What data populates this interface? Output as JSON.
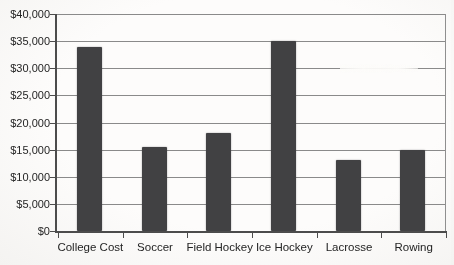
{
  "chart_data": {
    "type": "bar",
    "categories": [
      "College Cost",
      "Soccer",
      "Field Hockey",
      "Ice Hockey",
      "Lacrosse",
      "Rowing"
    ],
    "values": [
      34000,
      15500,
      18000,
      35000,
      13000,
      15000
    ],
    "title": "",
    "xlabel": "",
    "ylabel": "",
    "ylim": [
      0,
      40000
    ],
    "ytick_step": 5000,
    "ytick_labels": [
      "$0",
      "$5,000",
      "$10,000",
      "$15,000",
      "$20,000",
      "$25,000",
      "$30,000",
      "$35,000",
      "$40,000"
    ],
    "grid": true,
    "legend": "none",
    "colors": {
      "bar": "#414143",
      "gridline": "#8a8a8a",
      "axis": "#4c4c4c",
      "text": "#242424",
      "background": "#fbfaf8"
    }
  }
}
